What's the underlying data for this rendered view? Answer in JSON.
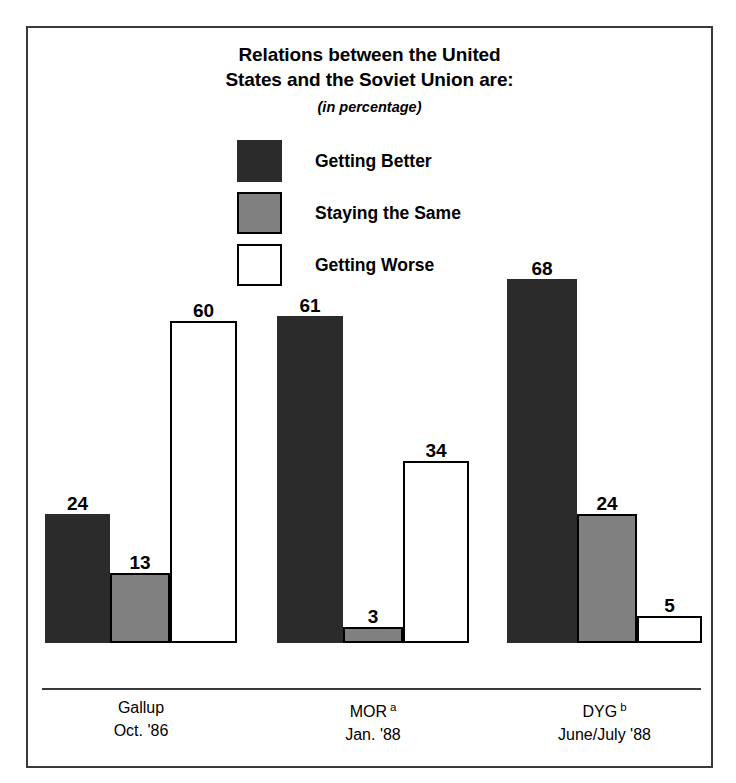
{
  "chart_data": {
    "type": "bar",
    "title": "Relations between the United States and the Soviet Union are:",
    "title_lines": [
      "Relations between the United",
      "States and the Soviet Union are:"
    ],
    "subtitle": "(in percentage)",
    "xlabel": "",
    "ylabel": "",
    "ylim": [
      0,
      70
    ],
    "grid": false,
    "legend_position": "top-center",
    "categories": [
      "Gallup Oct. '86",
      "MOR a Jan. '88",
      "DYG b June/July '88"
    ],
    "series": [
      {
        "name": "Getting Better",
        "color": "#2b2b2b",
        "values": [
          24,
          61,
          68
        ]
      },
      {
        "name": "Staying the Same",
        "color": "#808080",
        "values": [
          13,
          3,
          24
        ]
      },
      {
        "name": "Getting Worse",
        "color": "#ffffff",
        "values": [
          60,
          34,
          5
        ]
      }
    ],
    "groups": [
      {
        "name": "Gallup",
        "superscript": "",
        "date": "Oct. '86",
        "bars": [
          {
            "series": "Getting Better",
            "value": 24
          },
          {
            "series": "Staying the Same",
            "value": 13
          },
          {
            "series": "Getting Worse",
            "value": 60
          }
        ]
      },
      {
        "name": "MOR",
        "superscript": "a",
        "date": "Jan. '88",
        "bars": [
          {
            "series": "Getting Better",
            "value": 61
          },
          {
            "series": "Staying the Same",
            "value": 3
          },
          {
            "series": "Getting Worse",
            "value": 34
          }
        ]
      },
      {
        "name": "DYG",
        "superscript": "b",
        "date": "June/July '88",
        "bars": [
          {
            "series": "Getting Better",
            "value": 68
          },
          {
            "series": "Staying the Same",
            "value": 24
          },
          {
            "series": "Getting Worse",
            "value": 5
          }
        ]
      }
    ]
  },
  "legend": {
    "items": [
      {
        "label": "Getting Better",
        "color": "#2b2b2b",
        "border": "#2b2b2b"
      },
      {
        "label": "Staying the Same",
        "color": "#808080",
        "border": "#000000"
      },
      {
        "label": "Getting Worse",
        "color": "#ffffff",
        "border": "#000000"
      }
    ]
  },
  "colors": {
    "getting_better": "#2b2b2b",
    "staying_the_same": "#808080",
    "getting_worse": "#ffffff",
    "frame": "#3a3a3a",
    "text": "#000000",
    "background": "#ffffff"
  },
  "layout": {
    "scale_px_per_unit": 5.36,
    "baseline_y": 660,
    "group_x": [
      {
        "left": 17,
        "widths": [
          65,
          60,
          67
        ]
      },
      {
        "left": 249,
        "widths": [
          66,
          60,
          66
        ]
      },
      {
        "left": 479,
        "widths": [
          70,
          60,
          65
        ]
      }
    ]
  }
}
